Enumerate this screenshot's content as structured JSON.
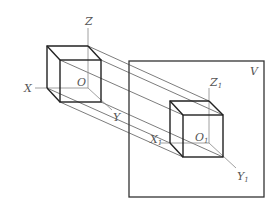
{
  "diagram": {
    "type": "parallel-projection-of-cube-onto-plane",
    "labels": {
      "object_axes": {
        "z": "Z",
        "x": "X",
        "y": "Y",
        "origin": "O"
      },
      "projected_axes": {
        "z": "Z",
        "z_sub": "1",
        "x": "X",
        "x_sub": "1",
        "y": "Y",
        "y_sub": "1",
        "origin": "O",
        "origin_sub": "1"
      },
      "plane": "V"
    },
    "colors": {
      "edge": "#222222",
      "axis": "#888888",
      "projection_line": "#444444",
      "frame": "#333333",
      "label": "#555555"
    }
  }
}
